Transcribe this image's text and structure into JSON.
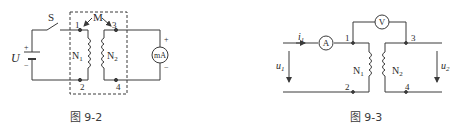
{
  "figures": [
    {
      "caption": "图 9-2",
      "labels": {
        "switch": "S",
        "source": "U",
        "source_plus": "+",
        "source_minus": "−",
        "mutual": "M",
        "terminal_1": "1",
        "terminal_2": "2",
        "terminal_3": "3",
        "terminal_4": "4",
        "coil_1": "N",
        "coil_1_sub": "1",
        "coil_2": "N",
        "coil_2_sub": "2",
        "meter": "mA",
        "meter_plus": "+",
        "meter_minus": "−"
      }
    },
    {
      "caption": "图 9-3",
      "labels": {
        "current": "i",
        "current_sub": "1",
        "ammeter": "A",
        "voltmeter": "V",
        "terminal_1": "1",
        "terminal_2": "2",
        "terminal_3": "3",
        "terminal_4": "4",
        "coil_1": "N",
        "coil_1_sub": "1",
        "coil_2": "N",
        "coil_2_sub": "2",
        "voltage_1": "u",
        "voltage_1_sub": "1",
        "voltage_2": "u",
        "voltage_2_sub": "2"
      }
    }
  ],
  "colors": {
    "stroke": "#3a3a3a",
    "background": "#ffffff"
  }
}
